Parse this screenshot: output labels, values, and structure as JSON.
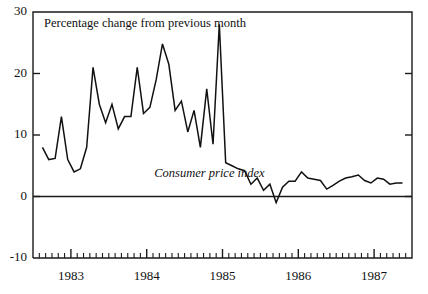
{
  "chart_data": {
    "type": "line",
    "title": "Percentage change from previous month",
    "xlabel": "",
    "ylabel": "",
    "ylim": [
      -10,
      30
    ],
    "xlim": [
      1982.5,
      1987.5
    ],
    "grid": false,
    "legend_position": "inline-annotation",
    "annotations": [
      {
        "text": "Consumer price index",
        "x": 1984.1,
        "y": 3.2,
        "style": "italic"
      }
    ],
    "y_ticks": [
      -10,
      0,
      10,
      20,
      30
    ],
    "y_tick_labels": [
      "-10",
      "0",
      "10",
      "20",
      "30"
    ],
    "x_ticks": [
      1983,
      1984,
      1985,
      1986,
      1987
    ],
    "x_tick_labels": [
      "1983",
      "1984",
      "1985",
      "1986",
      "1987"
    ],
    "x_minor_tick_interval_months": 1,
    "zero_line": 0,
    "series": [
      {
        "name": "Consumer price index",
        "color": "#111111",
        "x": [
          1982.625,
          1982.708,
          1982.792,
          1982.875,
          1982.958,
          1983.042,
          1983.125,
          1983.208,
          1983.292,
          1983.375,
          1983.458,
          1983.542,
          1983.625,
          1983.708,
          1983.792,
          1983.875,
          1983.958,
          1984.042,
          1984.125,
          1984.208,
          1984.292,
          1984.375,
          1984.458,
          1984.542,
          1984.625,
          1984.708,
          1984.792,
          1984.875,
          1984.958,
          1985.042,
          1985.125,
          1985.208,
          1985.292,
          1985.375,
          1985.458,
          1985.542,
          1985.625,
          1985.708,
          1985.792,
          1985.875,
          1985.958,
          1986.042,
          1986.125,
          1986.208,
          1986.292,
          1986.375,
          1986.458,
          1986.542,
          1986.625,
          1986.708,
          1986.792,
          1986.875,
          1986.958,
          1987.042,
          1987.125,
          1987.208,
          1987.292,
          1987.375
        ],
        "values": [
          8.0,
          6.0,
          6.2,
          13.0,
          6.0,
          4.0,
          4.5,
          8.0,
          21.0,
          15.0,
          12.0,
          15.0,
          11.0,
          13.0,
          13.0,
          21.0,
          13.5,
          14.5,
          19.0,
          24.8,
          21.5,
          14.0,
          15.5,
          10.5,
          14.0,
          8.0,
          17.5,
          8.5,
          28.0,
          5.5,
          5.0,
          4.5,
          4.2,
          2.0,
          3.0,
          1.0,
          2.0,
          -1.0,
          1.5,
          2.5,
          2.5,
          4.0,
          3.0,
          2.8,
          2.6,
          1.2,
          1.8,
          2.5,
          3.0,
          3.2,
          3.5,
          2.6,
          2.2,
          3.0,
          2.8,
          2.0,
          2.2,
          2.2
        ]
      }
    ]
  },
  "axes": {
    "y_axis_name": "percentage-change-axis",
    "x_axis_name": "year-axis"
  }
}
